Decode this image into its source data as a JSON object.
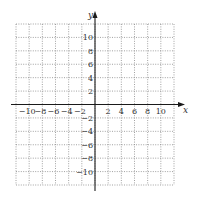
{
  "chart_data": {
    "type": "scatter",
    "title": "",
    "xlabel": "x",
    "ylabel": "y",
    "xlim": [
      -12,
      12
    ],
    "ylim": [
      -12,
      12
    ],
    "grid": true,
    "grid_step": 2,
    "series": [],
    "x_ticks": [
      -10,
      -8,
      -6,
      -4,
      -2,
      2,
      4,
      6,
      8,
      10
    ],
    "y_ticks": [
      10,
      8,
      6,
      4,
      2,
      -2,
      -4,
      -6,
      -8,
      -10
    ],
    "x_tick_labels": [
      "−10",
      "−8",
      "−6",
      "−4",
      "−2",
      "2",
      "4",
      "6",
      "8",
      "10"
    ],
    "y_tick_labels": [
      "10",
      "8",
      "6",
      "4",
      "2",
      "−2",
      "−4",
      "−6",
      "−8",
      "−10"
    ]
  }
}
